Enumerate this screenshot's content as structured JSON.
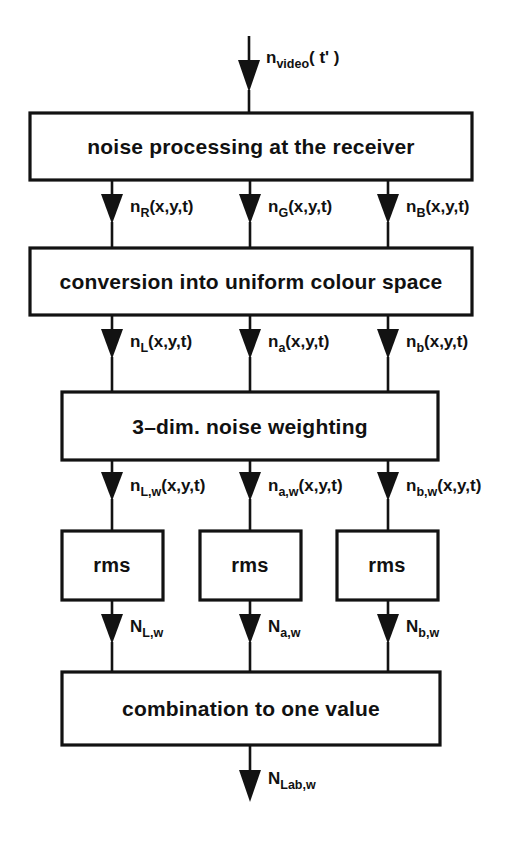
{
  "diagram": {
    "background_color": "#ffffff",
    "line_color": "#121212",
    "input_signal": {
      "base": "n",
      "subscript": "video",
      "tail": "( t' )",
      "full": "n_video( t' )"
    },
    "output_signal": {
      "base": "N",
      "subscript": "Lab,w",
      "tail": "",
      "full": "N_Lab,w"
    },
    "blocks": [
      {
        "id": "noise-processing",
        "label": "noise processing at the receiver"
      },
      {
        "id": "colour-conversion",
        "label": "conversion into uniform colour space"
      },
      {
        "id": "noise-weighting",
        "label": "3–dim. noise weighting"
      },
      {
        "id": "rms-left",
        "label": "rms"
      },
      {
        "id": "rms-middle",
        "label": "rms"
      },
      {
        "id": "rms-right",
        "label": "rms"
      },
      {
        "id": "combination",
        "label": "combination to one value"
      }
    ],
    "signal_rows": [
      {
        "id": "rgb-signals",
        "signals": [
          {
            "base": "n",
            "subscript": "R",
            "tail": "(x,y,t)",
            "full": "n_R(x,y,t)"
          },
          {
            "base": "n",
            "subscript": "G",
            "tail": "(x,y,t)",
            "full": "n_G(x,y,t)"
          },
          {
            "base": "n",
            "subscript": "B",
            "tail": "(x,y,t)",
            "full": "n_B(x,y,t)"
          }
        ]
      },
      {
        "id": "lab-signals",
        "signals": [
          {
            "base": "n",
            "subscript": "L",
            "tail": "(x,y,t)",
            "full": "n_L(x,y,t)"
          },
          {
            "base": "n",
            "subscript": "a",
            "tail": "(x,y,t)",
            "full": "n_a(x,y,t)"
          },
          {
            "base": "n",
            "subscript": "b",
            "tail": "(x,y,t)",
            "full": "n_b(x,y,t)"
          }
        ]
      },
      {
        "id": "weighted-signals",
        "signals": [
          {
            "base": "n",
            "subscript": "L,w",
            "tail": "(x,y,t)",
            "full": "n_L,w(x,y,t)"
          },
          {
            "base": "n",
            "subscript": "a,w",
            "tail": "(x,y,t)",
            "full": "n_a,w(x,y,t)"
          },
          {
            "base": "n",
            "subscript": "b,w",
            "tail": "(x,y,t)",
            "full": "n_b,w(x,y,t)"
          }
        ]
      },
      {
        "id": "rms-outputs",
        "signals": [
          {
            "base": "N",
            "subscript": "L,w",
            "tail": "",
            "full": "N_L,w"
          },
          {
            "base": "N",
            "subscript": "a,w",
            "tail": "",
            "full": "N_a,w"
          },
          {
            "base": "N",
            "subscript": "b,w",
            "tail": "",
            "full": "N_b,w"
          }
        ]
      }
    ]
  }
}
